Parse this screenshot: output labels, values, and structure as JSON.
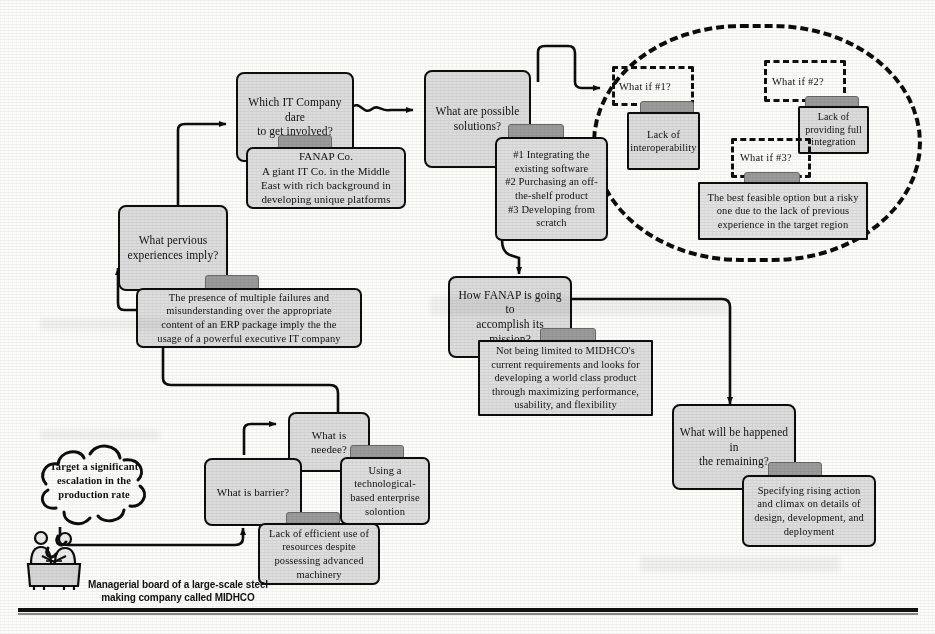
{
  "diagram": {
    "colors": {
      "node_fill": "#dcdcdc",
      "note_fill": "#dedede",
      "tab_fill": "#9b9b9b",
      "stroke": "#0d0d0d",
      "page": "#fdfdfc"
    }
  },
  "nodes": {
    "which_it_company": "Which IT Company dare to get involved?",
    "what_are_solutions": "What are possible solutions?",
    "what_pervious": "What pervious experiences imply?",
    "how_fanap": "How FANAP is going to accomplish its mission?",
    "what_will_happen": "What will be happened in the remaining?",
    "what_is_needee": "What is needee?",
    "what_is_barrier": "What is barrier?",
    "lack_interoperability": "Lack of interoperability",
    "lack_integration": "Lack of providing full integration"
  },
  "notes": {
    "fanap": "FANAP Co.\nA giant IT Co. in the Middle East with rich background in developing unique platforms",
    "solutions_list": "#1 Integrating the existing software #2 Purchasing an off-the-shelf product #3 Developing from scratch",
    "pervious_note": "The presence of multiple failures and misunderstanding over the appropriate content of an ERP package imply the the usage of a powerful executive IT company",
    "fanap_mission": "Not being limited to MIDHCO's current requirements and looks for developing a world class product through maximizing performance, usability, and flexibility",
    "remaining_note": "Specifying rising action and climax on details of design, development, and deployment",
    "best_option": "The best feasible option but a risky one due to the lack of previous experience in the target region",
    "needee_note": "Using a technological-based enterprise solontion",
    "barrier_note": "Lack of efficient use of resources despite possessing advanced machinery"
  },
  "question_frames": {
    "what_if_1": "What if #1?",
    "what_if_2": "What if #2?",
    "what_if_3": "What if #3?"
  },
  "cloud": {
    "text": "Target a significant escalation in the production rate"
  },
  "caption": {
    "midhco": "Managerial board of a large-scale steel making company called MIDHCO"
  },
  "solutions_lines": [
    "#1 Integrating the",
    "existing software",
    "#2 Purchasing an off-",
    "the-shelf product",
    "#3 Developing from",
    "scratch"
  ],
  "fanap_lines": [
    "FANAP Co.",
    "A giant IT Co. in the Middle",
    "East with rich background in",
    "developing unique platforms"
  ],
  "pervious_lines": [
    "The presence of multiple failures and",
    "misunderstanding over the appropriate",
    "content of an ERP package imply the the",
    "usage of a powerful executive IT company"
  ],
  "mission_lines": [
    "Not being limited to MIDHCO's",
    "current requirements and looks for",
    "developing a world class product",
    "through maximizing performance,",
    "usability, and flexibility"
  ],
  "remaining_lines": [
    "Specifying rising action",
    "and climax on details of",
    "design, development, and",
    "deployment"
  ],
  "best_option_lines": [
    "The best feasible option but a risky",
    "one due to the lack of previous",
    "experience in the target region"
  ],
  "needee_note_lines": [
    "Using a",
    "technological-",
    "based enterprise",
    "solontion"
  ],
  "barrier_note_lines": [
    "Lack of efficient use of",
    "resources despite",
    "possessing advanced",
    "machinery"
  ],
  "cloud_lines": [
    "Target a significant",
    "escalation in the",
    "production rate"
  ],
  "caption_lines": [
    "Managerial board of a large-scale steel",
    "making company called MIDHCO"
  ],
  "node_lines": {
    "which_it_company": [
      "Which IT Company dare",
      "to get involved?"
    ],
    "what_are_solutions": [
      "What are possible",
      "solutions?"
    ],
    "what_pervious": [
      "What pervious",
      "experiences imply?"
    ],
    "how_fanap": [
      "How FANAP is going to",
      "accomplish its mission?"
    ],
    "what_will_happen": [
      "What will be happened in",
      "the remaining?"
    ],
    "lack_interoperability": [
      "Lack of",
      "interoperability"
    ],
    "lack_integration": [
      "Lack of",
      "providing full",
      "integration"
    ]
  }
}
